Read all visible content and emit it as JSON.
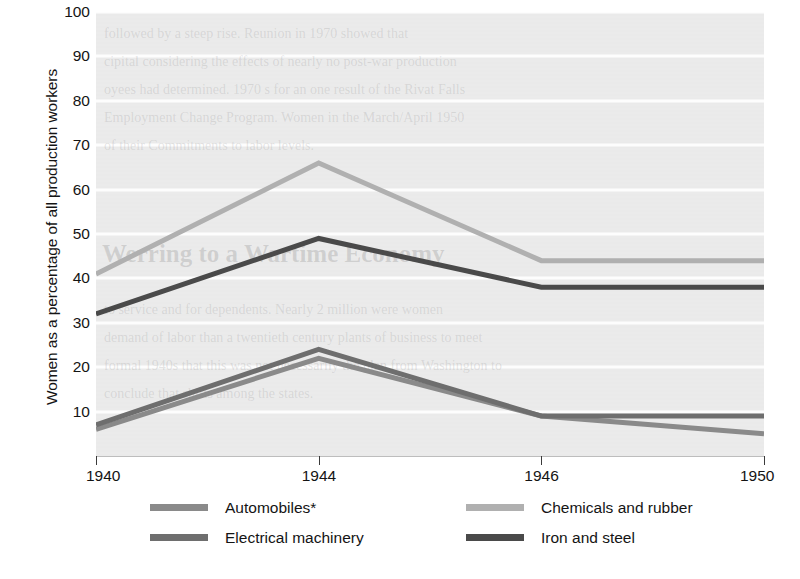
{
  "chart_data": {
    "type": "line",
    "title": "",
    "xlabel": "",
    "ylabel": "Women as a percentage of all production workers",
    "categories": [
      "1940",
      "1944",
      "1946",
      "1950"
    ],
    "x_tick_labels": [
      "1940",
      "1944",
      "1946",
      "1950"
    ],
    "y_tick_labels": [
      "10",
      "20",
      "30",
      "40",
      "50",
      "60",
      "70",
      "80",
      "90",
      "100"
    ],
    "y_tick_values": [
      10,
      20,
      30,
      40,
      50,
      60,
      70,
      80,
      90,
      100
    ],
    "ylim": [
      0,
      100
    ],
    "grid": "horizontal",
    "legend_position": "bottom",
    "series": [
      {
        "name": "Automobiles*",
        "color": "#8a8a8a",
        "values": [
          6,
          22,
          9,
          5
        ]
      },
      {
        "name": "Chemicals and rubber",
        "color": "#b0b0b0",
        "values": [
          41,
          66,
          44,
          44
        ]
      },
      {
        "name": "Electrical machinery",
        "color": "#6e6e6e",
        "values": [
          7,
          24,
          9,
          9
        ]
      },
      {
        "name": "Iron and steel",
        "color": "#4a4a4a",
        "values": [
          32,
          49,
          38,
          38
        ]
      }
    ]
  },
  "axis": {
    "y_title": "Women as a percentage of all production workers"
  },
  "legend": {
    "items": [
      {
        "label": "Automobiles*",
        "color": "#8a8a8a"
      },
      {
        "label": "Chemicals and rubber",
        "color": "#b0b0b0"
      },
      {
        "label": "Electrical machinery",
        "color": "#6e6e6e"
      },
      {
        "label": "Iron and steel",
        "color": "#4a4a4a"
      }
    ]
  },
  "background": {
    "plot_fill": "#ebebeb",
    "gridline_color": "#fdfdfd",
    "page_fill": "#ffffff",
    "bleed_through_lines": [
      "followed by a steep rise. Reunion in 1970 showed that",
      "cipital considering the effects of nearly no post-war production",
      "oyees had determined. 1970 s for an one result of the Rivat Falls",
      "Employment Change Program. Women in the March/April 1950",
      "of their Commitments to labor levels.",
      "Werring to a Wartime Economy",
      "to service and for dependents. Nearly 2 million were women",
      "demand of labor than a twentieth century plants of business to meet",
      "formal 1940s that this was not necessarily the plan from Washington to",
      "conclude that shifts among the states."
    ]
  }
}
